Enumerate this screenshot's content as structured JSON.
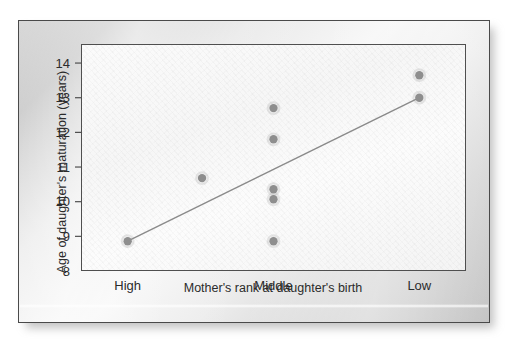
{
  "figure": {
    "panel_bg_color": "#e6e6e6",
    "plot_bg_color": "#f8f8f8",
    "frame_color": "#4f4f4f",
    "point_color": "#8e8e8e",
    "line_color": "#8a8a8a",
    "text_color": "#2b2b2b"
  },
  "chart_data": {
    "type": "scatter",
    "title": "",
    "subtitle": "",
    "xlabel": "Mother's rank at daughter's birth",
    "ylabel": "Age of daughter's maturation (years)",
    "categories": [
      "High",
      "Middle",
      "Low"
    ],
    "category_positions": [
      0,
      1,
      2
    ],
    "xlim": [
      -0.32,
      2.32
    ],
    "ylim": [
      8,
      14.55
    ],
    "yticks": [
      8,
      9,
      10,
      11,
      12,
      13,
      14
    ],
    "ytick_labels": [
      "8",
      "9",
      "10",
      "11",
      "12",
      "13",
      "14"
    ],
    "xtick_labels": [
      "High",
      "Middle",
      "Low"
    ],
    "grid": false,
    "legend": null,
    "legend_position": "none",
    "series": [
      {
        "name": "Daughters",
        "marker": "filled-circle",
        "marker_size": 4.2,
        "points": [
          {
            "x": 0.0,
            "category": "High",
            "y": 8.86
          },
          {
            "x": 0.51,
            "category": "",
            "y": 10.68
          },
          {
            "x": 1.0,
            "category": "Middle",
            "y": 12.7
          },
          {
            "x": 1.0,
            "category": "Middle",
            "y": 11.8
          },
          {
            "x": 1.0,
            "category": "Middle",
            "y": 10.36
          },
          {
            "x": 1.0,
            "category": "Middle",
            "y": 10.07
          },
          {
            "x": 1.0,
            "category": "Middle",
            "y": 8.86
          },
          {
            "x": 2.0,
            "category": "Low",
            "y": 13.65
          },
          {
            "x": 2.0,
            "category": "Low",
            "y": 13.0
          }
        ]
      }
    ],
    "trend_line": {
      "name": "regression line",
      "x_start": 0.0,
      "y_start": 8.86,
      "x_end": 2.0,
      "y_end": 13.0
    },
    "annotations": []
  }
}
